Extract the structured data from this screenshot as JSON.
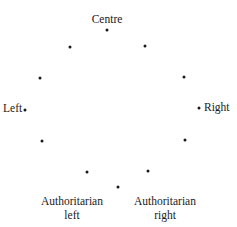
{
  "diagram": {
    "type": "circular political spectrum",
    "labels": {
      "top": "Centre",
      "left": "Left",
      "right": "Right",
      "bottom_left_line1": "Authoritarian",
      "bottom_left_line2": "left",
      "bottom_right_line1": "Authoritarian",
      "bottom_right_line2": "right"
    },
    "points": [
      {
        "x": 107,
        "y": 30
      },
      {
        "x": 145,
        "y": 46
      },
      {
        "x": 184,
        "y": 77
      },
      {
        "x": 199,
        "y": 108
      },
      {
        "x": 185,
        "y": 140
      },
      {
        "x": 148,
        "y": 171
      },
      {
        "x": 118,
        "y": 187
      },
      {
        "x": 87,
        "y": 172
      },
      {
        "x": 42,
        "y": 141
      },
      {
        "x": 25,
        "y": 110
      },
      {
        "x": 40,
        "y": 78
      },
      {
        "x": 70,
        "y": 47
      }
    ],
    "dot_color": "#1a1a1a"
  }
}
